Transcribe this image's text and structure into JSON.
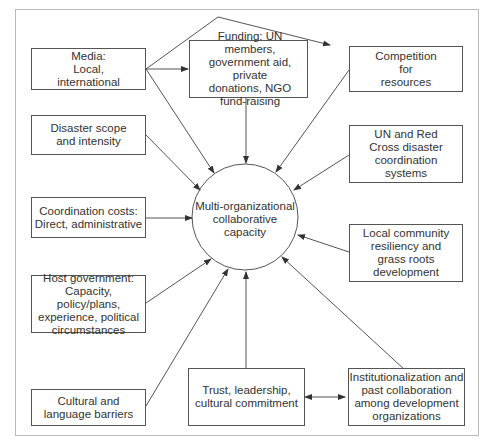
{
  "diagram": {
    "center": {
      "label": "Multi-organizational\ncollaborative\ncapacity"
    },
    "nodes": [
      {
        "id": "media",
        "label": "Media:\nLocal,\ninternational"
      },
      {
        "id": "funding",
        "label": "Funding: UN members,\ngovernment aid, private\ndonations, NGO\nfund-raising"
      },
      {
        "id": "competition",
        "label": "Competition\nfor\nresources"
      },
      {
        "id": "disaster",
        "label": "Disaster scope\nand intensity"
      },
      {
        "id": "un_redcross",
        "label": "UN and Red\nCross disaster\ncoordination\nsystems"
      },
      {
        "id": "coordination",
        "label": "Coordination costs:\nDirect, administrative"
      },
      {
        "id": "local_community",
        "label": "Local community\nresiliency and\ngrass roots\ndevelopment"
      },
      {
        "id": "host_gov",
        "label": "Host government:\nCapacity, policy/plans,\nexperience, political\ncircumstances"
      },
      {
        "id": "cultural",
        "label": "Cultural and\nlanguage barriers"
      },
      {
        "id": "trust",
        "label": "Trust, leadership,\ncultural commitment"
      },
      {
        "id": "institutionalization",
        "label": "Institutionalization and\npast collaboration\namong development\norganizations"
      }
    ],
    "edges": [
      {
        "from": "media",
        "to": "funding"
      },
      {
        "from": "media",
        "to": "competition"
      },
      {
        "from": "media",
        "to": "center"
      },
      {
        "from": "funding",
        "to": "center"
      },
      {
        "from": "competition",
        "to": "center"
      },
      {
        "from": "disaster",
        "to": "center"
      },
      {
        "from": "un_redcross",
        "to": "center"
      },
      {
        "from": "coordination",
        "to": "center"
      },
      {
        "from": "local_community",
        "to": "center"
      },
      {
        "from": "host_gov",
        "to": "center"
      },
      {
        "from": "cultural",
        "to": "center"
      },
      {
        "from": "trust",
        "to": "center"
      },
      {
        "from": "institutionalization",
        "to": "center"
      },
      {
        "from": "trust",
        "to": "institutionalization",
        "bidirectional": true
      }
    ]
  }
}
